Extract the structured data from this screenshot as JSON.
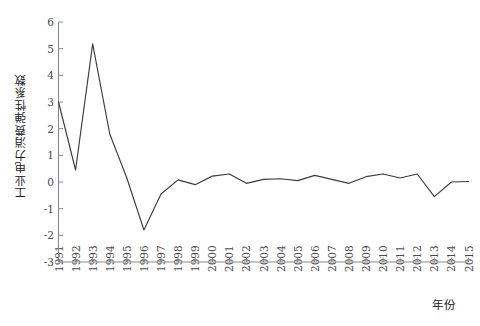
{
  "chart_data": {
    "type": "line",
    "title": "",
    "subtitle": "",
    "xlabel": "年份",
    "ylabel": "工业电力消费弹性系数",
    "xlim": [
      1991,
      2015
    ],
    "ylim": [
      -3,
      6
    ],
    "grid": false,
    "legend": null,
    "legend_position": "none",
    "line_color": "#3c3c3c",
    "axis_color": "#8a8a8a",
    "categories": [
      "1991",
      "1992",
      "1993",
      "1994",
      "1995",
      "1996",
      "1997",
      "1998",
      "1999",
      "2000",
      "2001",
      "2002",
      "2003",
      "2004",
      "2005",
      "2006",
      "2007",
      "2008",
      "2009",
      "2010",
      "2011",
      "2012",
      "2013",
      "2014",
      "2015"
    ],
    "x": [
      1991,
      1992,
      1993,
      1994,
      1995,
      1996,
      1997,
      1998,
      1999,
      2000,
      2001,
      2002,
      2003,
      2004,
      2005,
      2006,
      2007,
      2008,
      2009,
      2010,
      2011,
      2012,
      2013,
      2014,
      2015
    ],
    "values": [
      3.0,
      0.45,
      5.18,
      1.8,
      0.15,
      -1.8,
      -0.45,
      0.08,
      -0.1,
      0.22,
      0.3,
      -0.05,
      0.1,
      0.12,
      0.05,
      0.25,
      0.1,
      -0.05,
      0.2,
      0.3,
      0.15,
      0.3,
      -0.55,
      0.0,
      0.02
    ],
    "series": [
      {
        "name": "工业电力消费弹性系数",
        "values": [
          3.0,
          0.45,
          5.18,
          1.8,
          0.15,
          -1.8,
          -0.45,
          0.08,
          -0.1,
          0.22,
          0.3,
          -0.05,
          0.1,
          0.12,
          0.05,
          0.25,
          0.1,
          -0.05,
          0.2,
          0.3,
          0.15,
          0.3,
          -0.55,
          0.0,
          0.02
        ]
      }
    ],
    "ytick_labels": [
      "6",
      "5",
      "4",
      "3",
      "2",
      "1",
      "0",
      "-1",
      "-2",
      "-3"
    ],
    "ytick_values": [
      6,
      5,
      4,
      3,
      2,
      1,
      0,
      -1,
      -2,
      -3
    ]
  }
}
